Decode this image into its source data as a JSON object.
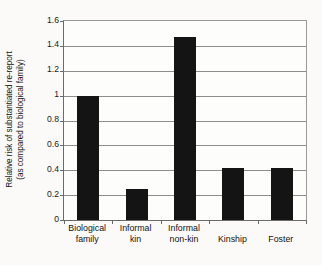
{
  "chart_data": {
    "type": "bar",
    "title": "",
    "xlabel": "",
    "ylabel": "Relative risk of substantiated re-report (as compared to biological family)",
    "ylabel_line1": "Relative risk of substantiated re-report",
    "ylabel_line2": "(as compared to biological family)",
    "categories": [
      "Biological family",
      "Informal kin",
      "Informal non-kin",
      "Kinship",
      "Foster"
    ],
    "category_lines": [
      [
        "Biological",
        "family"
      ],
      [
        "Informal",
        "kin"
      ],
      [
        "Informal",
        "non-kin"
      ],
      [
        "Kinship"
      ],
      [
        "Foster"
      ]
    ],
    "values": [
      1.0,
      0.25,
      1.47,
      0.42,
      0.42
    ],
    "ylim": [
      0,
      1.6
    ],
    "ytick_values": [
      0,
      0.2,
      0.4,
      0.6,
      0.8,
      1.0,
      1.2,
      1.4,
      1.6
    ],
    "ytick_labels": [
      "0",
      "0.2",
      "0.4",
      "0.6",
      "0.8",
      "1",
      "1.2",
      "1.4",
      "1.6"
    ],
    "grid": true,
    "legend": false,
    "bar_color": "#141414",
    "grid_color": "#8d8d8d",
    "axis_color": "#6b6b6b",
    "background_color": "#fbfaf8"
  }
}
